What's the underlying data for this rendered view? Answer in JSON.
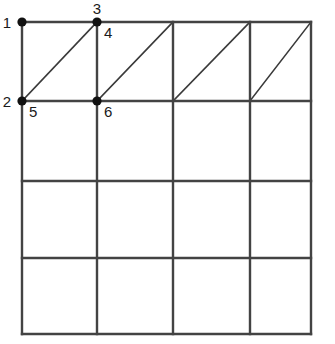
{
  "figure": {
    "background_color": "#ffffff",
    "grid_line_color": "#434343",
    "diagonal_line_color": "#3a3a3a",
    "node_color": "#111111",
    "label_color": "#1a1a1a"
  },
  "grid": {
    "columns": 4,
    "rows": 4,
    "x_positions": [
      22,
      97,
      173,
      250,
      311
    ],
    "y_positions": [
      22,
      101,
      181,
      258,
      334
    ],
    "diagonal_row_index": 0,
    "diagonal_direction": "bottom-left-to-top-right",
    "diagonal_cells": [
      0,
      1,
      2,
      3
    ]
  },
  "nodes": [
    {
      "id": "1",
      "label": "1",
      "x": 22,
      "y": 22,
      "label_x": 11,
      "label_y": 28,
      "label_anchor": "end"
    },
    {
      "id": "2",
      "label": "2",
      "x": 22,
      "y": 101,
      "label_x": 11,
      "label_y": 107,
      "label_anchor": "end"
    },
    {
      "id": "3",
      "label": "3",
      "x": 97,
      "y": 22,
      "label_x": 97,
      "label_y": 14,
      "label_anchor": "middle"
    },
    {
      "id": "4",
      "label": "4",
      "x": 97,
      "y": 22,
      "label_x": 104,
      "label_y": 38,
      "label_anchor": "start"
    },
    {
      "id": "5",
      "label": "5",
      "x": 22,
      "y": 101,
      "label_x": 29,
      "label_y": 117,
      "label_anchor": "start"
    },
    {
      "id": "6",
      "label": "6",
      "x": 97,
      "y": 101,
      "label_x": 104,
      "label_y": 117,
      "label_anchor": "start"
    }
  ],
  "marked_points": [
    {
      "ref": "1",
      "x": 22,
      "y": 22,
      "radius": 4.6
    },
    {
      "ref": "3",
      "x": 97,
      "y": 22,
      "radius": 4.6
    },
    {
      "ref": "2",
      "x": 22,
      "y": 101,
      "radius": 4.6
    },
    {
      "ref": "6",
      "x": 97,
      "y": 101,
      "radius": 4.6
    }
  ],
  "labels_list": [
    "1",
    "2",
    "3",
    "4",
    "5",
    "6"
  ]
}
